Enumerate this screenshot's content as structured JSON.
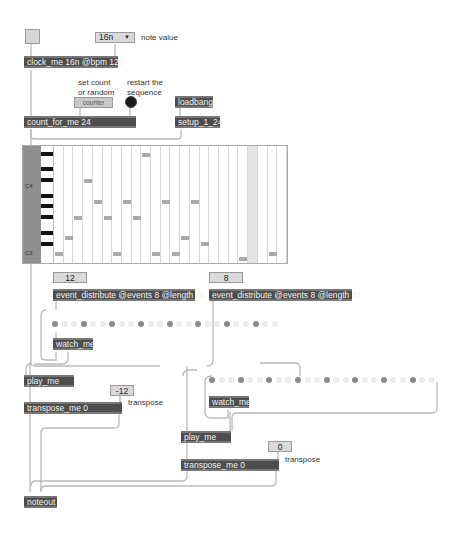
{
  "patch": {
    "toggle": {
      "state": "off"
    },
    "note_value_menu": {
      "selected": "16n",
      "label": "note value"
    },
    "clock": {
      "text": "clock_me 16n @bpm 120"
    },
    "counter_comment": {
      "line1": "set count",
      "line2": "or random"
    },
    "counter_message": {
      "text": "counter"
    },
    "restart_comment": {
      "line1": "restart the",
      "line2": "sequence"
    },
    "loadbang": {
      "text": "loadbang"
    },
    "setup": {
      "text": "setup_1_24"
    },
    "count_for_me": {
      "text": "count_for_me 24"
    },
    "piano_roll": {
      "label_high": "C4",
      "label_low": "C3",
      "columns": 24,
      "highlight_column": 20,
      "notes": [
        {
          "col": 0,
          "pitch": 0
        },
        {
          "col": 1,
          "pitch": 3
        },
        {
          "col": 2,
          "pitch": 7
        },
        {
          "col": 3,
          "pitch": 14
        },
        {
          "col": 4,
          "pitch": 10
        },
        {
          "col": 5,
          "pitch": 7
        },
        {
          "col": 6,
          "pitch": 0
        },
        {
          "col": 7,
          "pitch": 10
        },
        {
          "col": 8,
          "pitch": 7
        },
        {
          "col": 9,
          "pitch": 19
        },
        {
          "col": 10,
          "pitch": 0
        },
        {
          "col": 11,
          "pitch": 10
        },
        {
          "col": 12,
          "pitch": 0
        },
        {
          "col": 13,
          "pitch": 3
        },
        {
          "col": 14,
          "pitch": 10
        },
        {
          "col": 15,
          "pitch": 2
        },
        {
          "col": 19,
          "pitch": -1
        },
        {
          "col": 22,
          "pitch": 0
        }
      ]
    },
    "voice1": {
      "offset_number": "12",
      "distribute": "event_distribute @events 8 @length 24",
      "dots_on": [
        0,
        3,
        6,
        9,
        12,
        15,
        18,
        21
      ],
      "dot_count": 24,
      "watch": "watch_me",
      "play": "play_me",
      "transpose_number": "-12",
      "transpose_label": "transpose",
      "transpose_obj": "transpose_me 0"
    },
    "voice2": {
      "offset_number": "8",
      "distribute": "event_distribute @events 8 @length 24",
      "dots_on": [
        0,
        3,
        6,
        9,
        12,
        15,
        18,
        21
      ],
      "dot_count": 24,
      "watch": "watch_me",
      "play": "play_me",
      "transpose_number": "0",
      "transpose_label": "transpose",
      "transpose_obj": "transpose_me 0"
    },
    "noteout": {
      "text": "noteout"
    },
    "colors": {
      "object_bg": "#4d4d4d",
      "object_text": "#f2f2f2",
      "number_bg": "#d9d9d9",
      "note_fill": "#a9a9a9",
      "dot_on": "#8a8a8a",
      "dot_off": "#ececec",
      "wire": "#b5b5b5"
    }
  }
}
